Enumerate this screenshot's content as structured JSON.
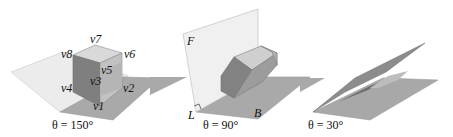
{
  "figure": {
    "panels": [
      {
        "id": "panel-150",
        "caption": "θ = 150°",
        "vertex_labels": [
          "v1",
          "v2",
          "v3",
          "v4",
          "v5",
          "v6",
          "v7",
          "v8"
        ]
      },
      {
        "id": "panel-90",
        "caption": "θ = 90°",
        "plane_labels": {
          "fold_plane": "F",
          "hinge_line": "L",
          "base_plane": "B"
        }
      },
      {
        "id": "panel-30",
        "caption": "θ = 30°"
      }
    ],
    "colors": {
      "light_plane": "#ececec",
      "dark_plane": "#a9a9a9",
      "cube_front": "#7d7d7d",
      "cube_side": "#999999",
      "cube_top": "#d6d6d6",
      "edge": "#888888"
    }
  }
}
